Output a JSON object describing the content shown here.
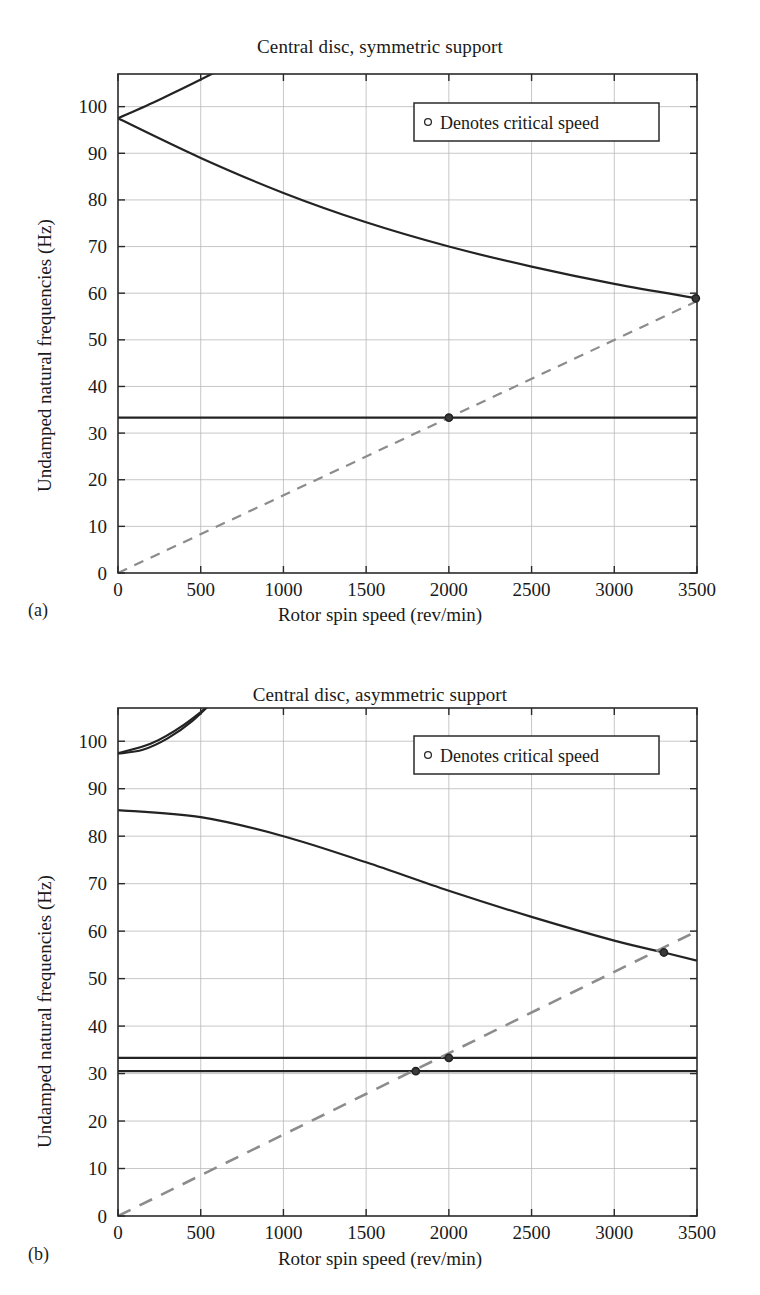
{
  "page": {
    "background": "#ffffff",
    "ink": "#1a1a1a",
    "grid_color": "#b9b9b9",
    "axis_color": "#2a2a2a",
    "curve_color": "#232323",
    "dashed_color": "#8c8c8c"
  },
  "figures": [
    {
      "panel_label": "(a)",
      "title": "Central disc, symmetric support",
      "xlabel": "Rotor spin speed (rev/min)",
      "ylabel": "Undamped natural frequencies (Hz)",
      "legend_label": "Denotes critical speed",
      "legend_marker": "circle-marker-icon"
    },
    {
      "panel_label": "(b)",
      "title": "Central disc, asymmetric support",
      "xlabel": "Rotor spin speed (rev/min)",
      "ylabel": "Undamped natural frequencies (Hz)",
      "legend_label": "Denotes critical speed",
      "legend_marker": "circle-marker-icon"
    }
  ],
  "chart_data": [
    {
      "type": "line",
      "title": "Central disc, symmetric support",
      "panel": "(a)",
      "xlabel": "Rotor spin speed (rev/min)",
      "ylabel": "Undamped natural frequencies (Hz)",
      "xlim": [
        0,
        3500
      ],
      "ylim": [
        0,
        107
      ],
      "xticks": [
        0,
        500,
        1000,
        1500,
        2000,
        2500,
        3000,
        3500
      ],
      "yticks": [
        0,
        10,
        20,
        30,
        40,
        50,
        60,
        70,
        80,
        90,
        100
      ],
      "grid": true,
      "legend": {
        "position": "upper-right-inside",
        "entries": [
          "Denotes critical speed"
        ]
      },
      "series": [
        {
          "name": "Forward whirl (conical)",
          "style": "solid",
          "x": [
            0,
            250,
            500,
            750,
            1000
          ],
          "y": [
            97.5,
            101.5,
            105.8,
            110.5,
            115.5
          ]
        },
        {
          "name": "Backward whirl (conical)",
          "style": "solid",
          "x": [
            0,
            500,
            1000,
            1500,
            2000,
            2500,
            3000,
            3500
          ],
          "y": [
            97.5,
            89.0,
            81.5,
            75.2,
            70.0,
            65.7,
            62.0,
            58.9
          ]
        },
        {
          "name": "Translational mode (speed independent)",
          "style": "solid",
          "x": [
            0,
            3500
          ],
          "y": [
            33.3,
            33.3
          ]
        },
        {
          "name": "1x synchronous excitation line",
          "style": "dashed",
          "x": [
            0,
            3500
          ],
          "y": [
            0,
            58.3
          ]
        }
      ],
      "critical_speeds": [
        {
          "x": 2000,
          "y": 33.3
        },
        {
          "x": 3500,
          "y": 58.9
        }
      ]
    },
    {
      "type": "line",
      "title": "Central disc, asymmetric support",
      "panel": "(b)",
      "xlabel": "Rotor spin speed (rev/min)",
      "ylabel": "Undamped natural frequencies (Hz)",
      "xlim": [
        0,
        3500
      ],
      "ylim": [
        0,
        107
      ],
      "xticks": [
        0,
        500,
        1000,
        1500,
        2000,
        2500,
        3000,
        3500
      ],
      "yticks": [
        0,
        10,
        20,
        30,
        40,
        50,
        60,
        70,
        80,
        90,
        100
      ],
      "grid": true,
      "legend": {
        "position": "upper-right-inside",
        "entries": [
          "Denotes critical speed"
        ]
      },
      "series": [
        {
          "name": "Upper conical mode (rising)",
          "style": "solid",
          "x": [
            0,
            200,
            400,
            600,
            800
          ],
          "y": [
            97.5,
            99.5,
            103.5,
            109.0,
            115.0
          ]
        },
        {
          "name": "Upper conical mode (branch)",
          "style": "solid",
          "x": [
            0,
            150,
            300,
            450,
            600,
            750
          ],
          "y": [
            97.4,
            98.2,
            100.6,
            104.3,
            109.3,
            114.6
          ]
        },
        {
          "name": "Backward whirl (conical)",
          "style": "solid",
          "x": [
            0,
            500,
            1000,
            1500,
            2000,
            2500,
            3000,
            3300,
            3500
          ],
          "y": [
            85.5,
            84.0,
            80.0,
            74.5,
            68.5,
            63.0,
            58.0,
            55.5,
            53.8
          ]
        },
        {
          "name": "Translational mode, stiff axis",
          "style": "solid",
          "x": [
            0,
            3500
          ],
          "y": [
            33.3,
            33.3
          ]
        },
        {
          "name": "Translational mode, soft axis",
          "style": "solid",
          "x": [
            0,
            3500
          ],
          "y": [
            30.5,
            30.5
          ]
        },
        {
          "name": "1x synchronous excitation line",
          "style": "dashed",
          "x": [
            0,
            3500
          ],
          "y": [
            0,
            60.0
          ]
        }
      ],
      "critical_speeds": [
        {
          "x": 1800,
          "y": 30.5
        },
        {
          "x": 2000,
          "y": 33.3
        },
        {
          "x": 3300,
          "y": 55.5
        }
      ]
    }
  ]
}
